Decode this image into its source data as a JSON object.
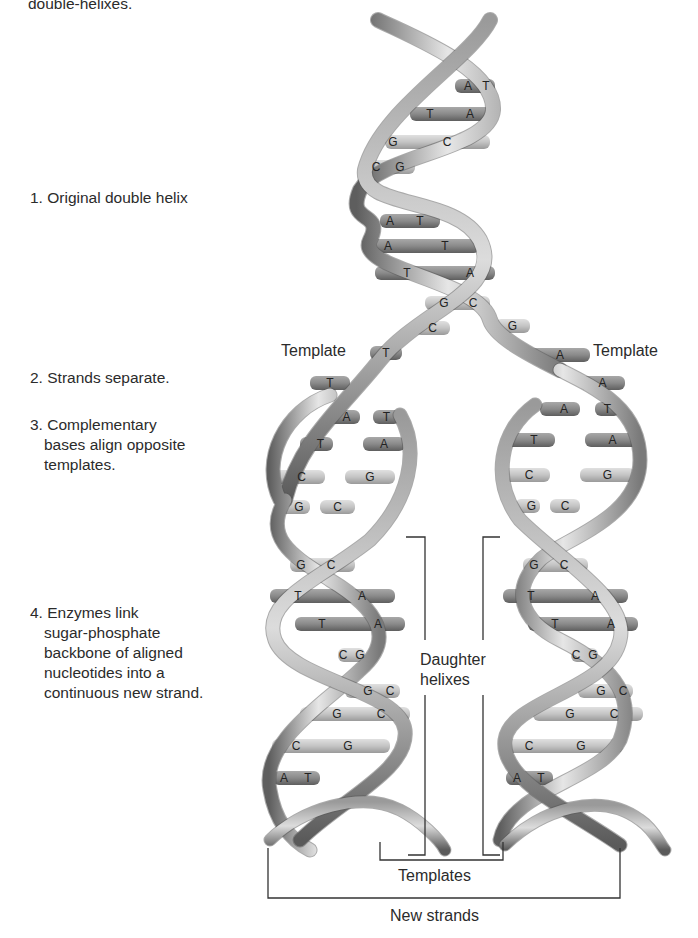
{
  "top_fragment": "double-helixes.",
  "steps": [
    {
      "id": 1,
      "lines": [
        "1. Original double helix"
      ]
    },
    {
      "id": 2,
      "lines": [
        "2. Strands separate."
      ]
    },
    {
      "id": 3,
      "lines": [
        "3. Complementary",
        "bases align opposite",
        "templates."
      ]
    },
    {
      "id": 4,
      "lines": [
        "4. Enzymes link",
        "sugar-phosphate",
        "backbone of aligned",
        "nucleotides into a",
        "continuous new strand."
      ]
    }
  ],
  "labels": {
    "template_left": "Template",
    "template_right": "Template",
    "daughter_1": "Daughter",
    "daughter_2": "helixes",
    "templates": "Templates",
    "new_strands": "New strands"
  },
  "original_helix_bases": [
    [
      "A",
      "T"
    ],
    [
      "T",
      "A"
    ],
    [
      "G",
      "C"
    ],
    [
      "C",
      "G"
    ],
    [
      "A",
      "T"
    ],
    [
      "A",
      "T"
    ],
    [
      "T",
      "A"
    ],
    [
      "G",
      "C"
    ]
  ],
  "separating_bases": {
    "left": [
      "C",
      "T",
      "T"
    ],
    "right": [
      "G",
      "A",
      "A"
    ]
  },
  "aligning_left": [
    [
      "A",
      "T"
    ],
    [
      "T",
      "A"
    ],
    [
      "C",
      "G"
    ],
    [
      "G",
      "C"
    ]
  ],
  "aligning_right": [
    [
      "A",
      "T"
    ],
    [
      "T",
      "A"
    ],
    [
      "C",
      "G"
    ],
    [
      "G",
      "C"
    ]
  ],
  "daughter_left": [
    [
      "G",
      "C"
    ],
    [
      "T",
      "A"
    ],
    [
      "T",
      "A"
    ],
    [
      "C",
      "G"
    ],
    [
      "G",
      "C"
    ],
    [
      "G",
      "C"
    ],
    [
      "C",
      "G"
    ],
    [
      "A",
      "T"
    ]
  ],
  "daughter_right": [
    [
      "G",
      "C"
    ],
    [
      "T",
      "A"
    ],
    [
      "T",
      "A"
    ],
    [
      "C",
      "G"
    ],
    [
      "G",
      "C"
    ],
    [
      "G",
      "C"
    ],
    [
      "C",
      "G"
    ],
    [
      "A",
      "T"
    ]
  ],
  "colors": {
    "backbone_light": "#d9d9d9",
    "backbone_dark": "#6e6e6e",
    "rung_dark": "#8a8a8a",
    "rung_light": "#c8c8c8",
    "bracket": "#333333"
  }
}
